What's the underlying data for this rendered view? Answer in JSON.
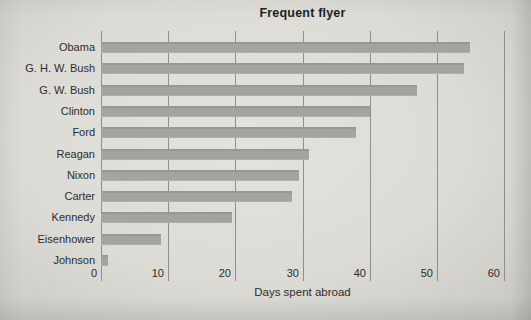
{
  "chart_data": {
    "type": "bar",
    "orientation": "horizontal",
    "title": "Frequent flyer",
    "xlabel": "Days spent abroad",
    "categories": [
      "Obama",
      "G. H. W. Bush",
      "G. W. Bush",
      "Clinton",
      "Ford",
      "Reagan",
      "Nixon",
      "Carter",
      "Kennedy",
      "Eisenhower",
      "Johnson"
    ],
    "values": [
      55,
      54,
      47,
      40,
      38,
      31,
      29.5,
      28.5,
      19.5,
      9,
      1
    ],
    "xlim": [
      0,
      60
    ],
    "x_ticks": [
      0,
      10,
      20,
      30,
      40,
      50,
      60
    ],
    "grid": "vertical-gridlines",
    "legend": "none",
    "colors": {
      "bar": "#a5a3a0",
      "gridline": "#8f8e8a",
      "text": "#2e2c29",
      "background": "#dcdbd6"
    }
  }
}
